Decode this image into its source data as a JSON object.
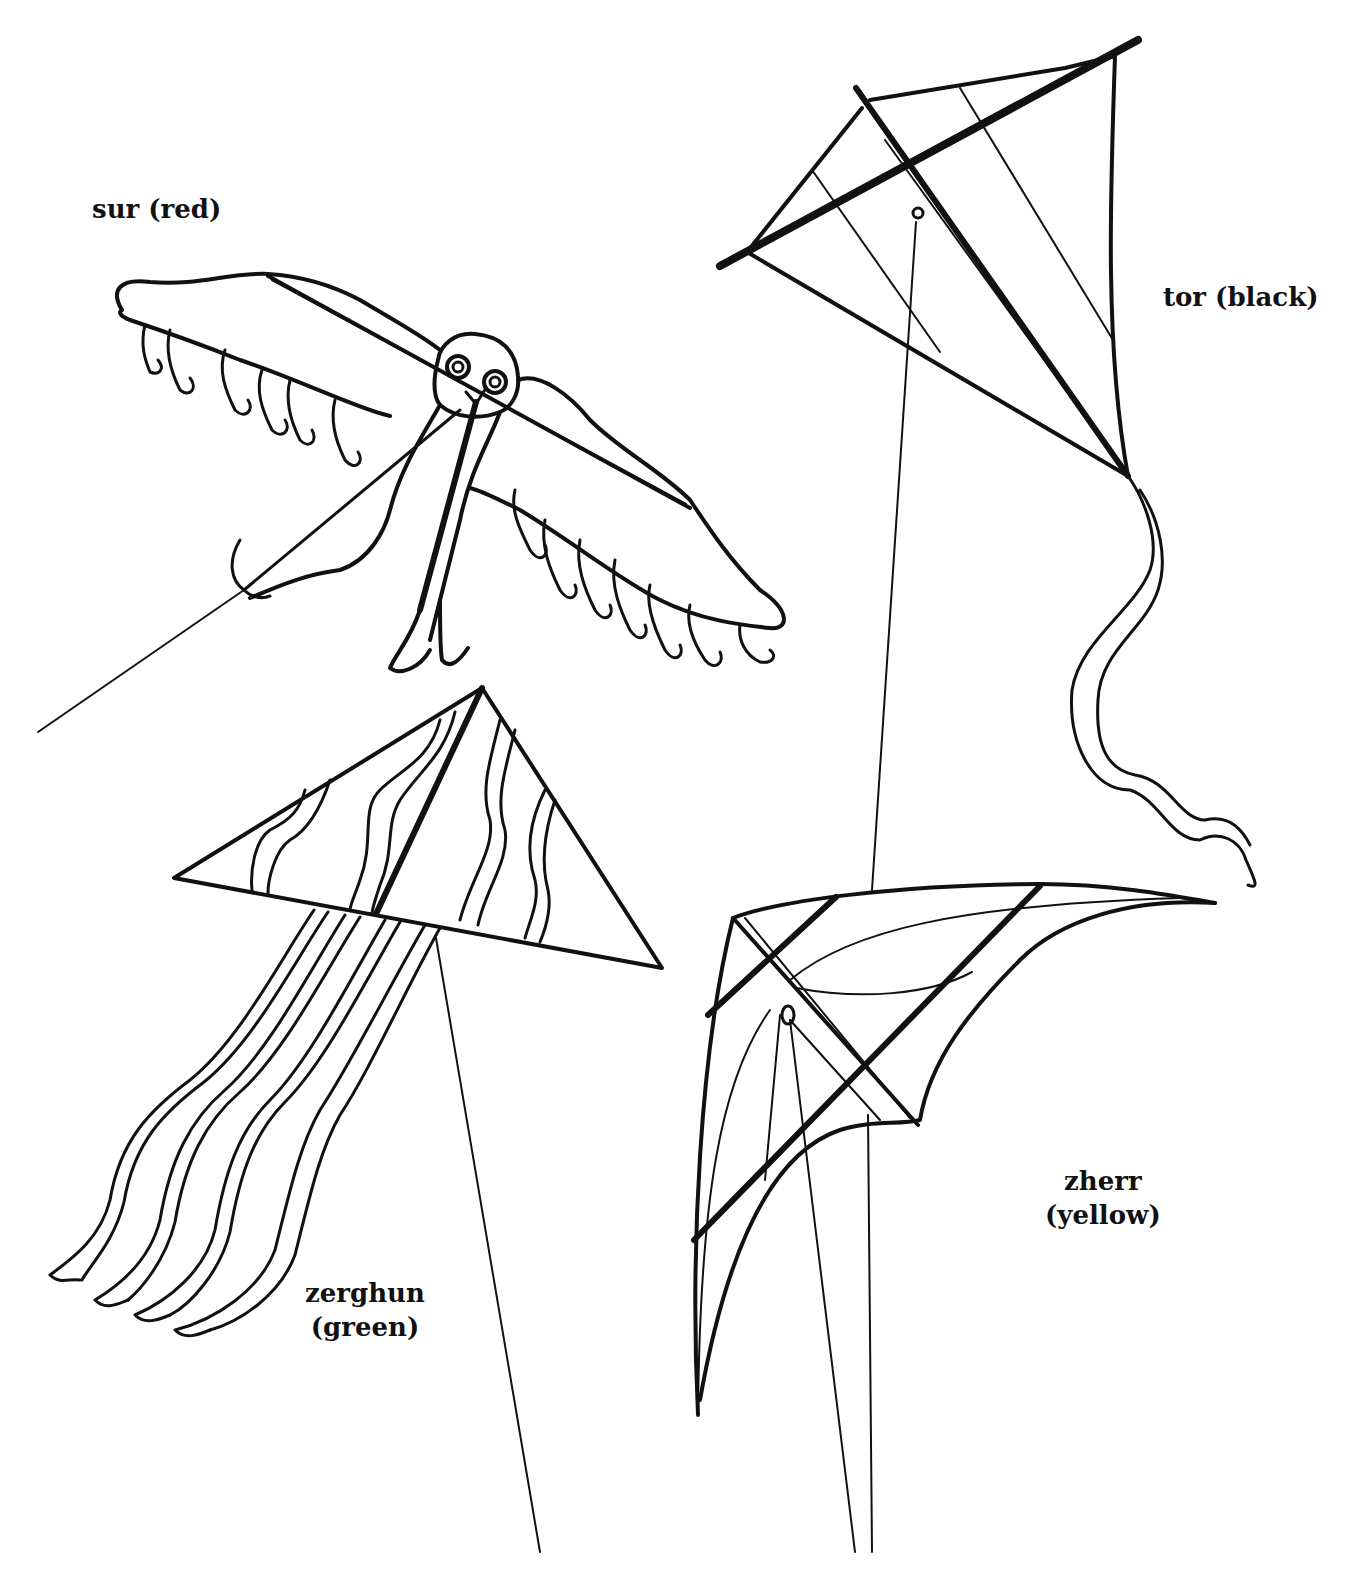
{
  "kites": [
    {
      "id": "sur",
      "name": "sur",
      "color_label": "(red)",
      "color": "#d32f2f",
      "type": "bird-kite"
    },
    {
      "id": "tor",
      "name": "tor",
      "color_label": "(black)",
      "color": "#111111",
      "type": "diamond-kite"
    },
    {
      "id": "zerghun",
      "name": "zerghun",
      "color_label": "(green)",
      "color": "#2e7d32",
      "type": "delta-kite-with-streamers"
    },
    {
      "id": "zherr",
      "name": "zherr",
      "color_label": "(yellow)",
      "color": "#f9d71c",
      "type": "stunt-kite"
    }
  ],
  "labels": {
    "sur": "sur (red)",
    "tor": "tor (black)",
    "zerghun_name": "zerghun",
    "zerghun_color": "(green)",
    "zherr_name": "zherr",
    "zherr_color": "(yellow)"
  }
}
